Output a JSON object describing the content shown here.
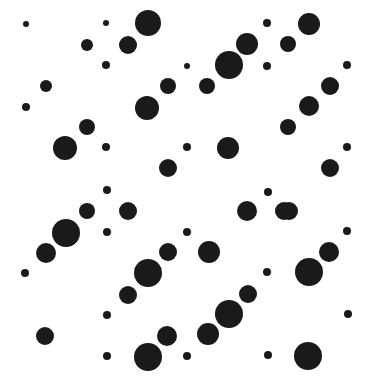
{
  "figure": {
    "title": "",
    "width": 372,
    "height": 381,
    "background_color": "#ffffff",
    "dot_color": "#1a1a1a"
  },
  "chart_data": {
    "type": "scatter",
    "title": "",
    "subtitle": "",
    "xlabel": "",
    "ylabel": "",
    "xlim": [
      0,
      372
    ],
    "ylim": [
      0,
      381
    ],
    "grid": false,
    "legend": null,
    "axis_visible": false,
    "marker": "circle",
    "marker_color": "#1a1a1a",
    "lattice_spacing_x": 20.5,
    "lattice_spacing_y": 20.5,
    "point_count": 62,
    "radius_range": [
      3,
      14
    ],
    "points": [
      {
        "x": 26,
        "y": 24,
        "r": 3
      },
      {
        "x": 106,
        "y": 23,
        "r": 3
      },
      {
        "x": 148,
        "y": 23,
        "r": 13
      },
      {
        "x": 267,
        "y": 23,
        "r": 4
      },
      {
        "x": 309,
        "y": 24,
        "r": 11
      },
      {
        "x": 87,
        "y": 45,
        "r": 6
      },
      {
        "x": 128,
        "y": 45,
        "r": 9
      },
      {
        "x": 247,
        "y": 44,
        "r": 11
      },
      {
        "x": 288,
        "y": 44,
        "r": 8
      },
      {
        "x": 106,
        "y": 65,
        "r": 4
      },
      {
        "x": 187,
        "y": 66,
        "r": 3
      },
      {
        "x": 229,
        "y": 65,
        "r": 14
      },
      {
        "x": 267,
        "y": 66,
        "r": 4
      },
      {
        "x": 347,
        "y": 65,
        "r": 4
      },
      {
        "x": 46,
        "y": 86,
        "r": 6
      },
      {
        "x": 168,
        "y": 86,
        "r": 8
      },
      {
        "x": 207,
        "y": 86,
        "r": 8
      },
      {
        "x": 330,
        "y": 86,
        "r": 9
      },
      {
        "x": 26,
        "y": 107,
        "r": 4
      },
      {
        "x": 147,
        "y": 108,
        "r": 12
      },
      {
        "x": 309,
        "y": 106,
        "r": 10
      },
      {
        "x": 87,
        "y": 127,
        "r": 8
      },
      {
        "x": 288,
        "y": 127,
        "r": 8
      },
      {
        "x": 65,
        "y": 148,
        "r": 12
      },
      {
        "x": 106,
        "y": 147,
        "r": 4
      },
      {
        "x": 187,
        "y": 147,
        "r": 4
      },
      {
        "x": 228,
        "y": 148,
        "r": 11
      },
      {
        "x": 347,
        "y": 147,
        "r": 4
      },
      {
        "x": 168,
        "y": 168,
        "r": 9
      },
      {
        "x": 330,
        "y": 168,
        "r": 9
      },
      {
        "x": 107,
        "y": 190,
        "r": 4
      },
      {
        "x": 268,
        "y": 192,
        "r": 4
      },
      {
        "x": 87,
        "y": 211,
        "r": 8
      },
      {
        "x": 128,
        "y": 211,
        "r": 9
      },
      {
        "x": 247,
        "y": 211,
        "r": 10
      },
      {
        "x": 284,
        "y": 211,
        "r": 9
      },
      {
        "x": 66,
        "y": 233,
        "r": 14
      },
      {
        "x": 107,
        "y": 232,
        "r": 4
      },
      {
        "x": 187,
        "y": 232,
        "r": 4
      },
      {
        "x": 347,
        "y": 231,
        "r": 4
      },
      {
        "x": 46,
        "y": 253,
        "r": 10
      },
      {
        "x": 168,
        "y": 252,
        "r": 9
      },
      {
        "x": 209,
        "y": 252,
        "r": 11
      },
      {
        "x": 329,
        "y": 252,
        "r": 10
      },
      {
        "x": 25,
        "y": 273,
        "r": 4
      },
      {
        "x": 148,
        "y": 273,
        "r": 14
      },
      {
        "x": 267,
        "y": 272,
        "r": 4
      },
      {
        "x": 309,
        "y": 272,
        "r": 14
      },
      {
        "x": 128,
        "y": 295,
        "r": 9
      },
      {
        "x": 248,
        "y": 294,
        "r": 9
      },
      {
        "x": 107,
        "y": 315,
        "r": 4
      },
      {
        "x": 229,
        "y": 314,
        "r": 14
      },
      {
        "x": 348,
        "y": 314,
        "r": 4
      },
      {
        "x": 45,
        "y": 336,
        "r": 9
      },
      {
        "x": 167,
        "y": 336,
        "r": 10
      },
      {
        "x": 208,
        "y": 334,
        "r": 11
      },
      {
        "x": 107,
        "y": 356,
        "r": 4
      },
      {
        "x": 148,
        "y": 357,
        "r": 14
      },
      {
        "x": 187,
        "y": 356,
        "r": 4
      },
      {
        "x": 268,
        "y": 355,
        "r": 4
      },
      {
        "x": 308,
        "y": 356,
        "r": 14
      },
      {
        "x": 289,
        "y": 211,
        "r": 9
      }
    ]
  }
}
